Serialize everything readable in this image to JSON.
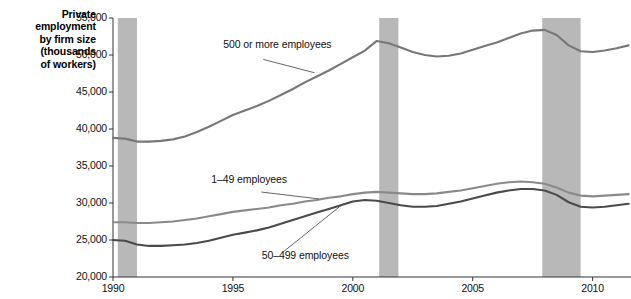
{
  "chart_data": {
    "type": "line",
    "title": "",
    "ylabel": "Private employment by firm size (thousands of workers)",
    "xlabel": "",
    "ylim": [
      20000,
      55000
    ],
    "xlim": [
      1990,
      2011.6
    ],
    "grid": false,
    "legend_position": "inline-annotations",
    "ytick_labels": [
      "55,000",
      "50,000",
      "45,000",
      "40,000",
      "35,000",
      "30,000",
      "25,000",
      "20,000"
    ],
    "ytick_values": [
      55000,
      50000,
      45000,
      40000,
      35000,
      30000,
      25000,
      20000
    ],
    "xtick_labels": [
      "1990",
      "1995",
      "2000",
      "2005",
      "2010"
    ],
    "xtick_values": [
      1990,
      1995,
      2000,
      2005,
      2010
    ],
    "annotations": [
      {
        "text": "500 or more employees",
        "x": 1994.6,
        "y": 51300
      },
      {
        "text": "1–49 employees",
        "x": 1994.1,
        "y": 33100
      },
      {
        "text": "50–499 employees",
        "x": 1996.2,
        "y": 22900
      }
    ],
    "shaded_regions": [
      {
        "name": "recession-1990-91",
        "x0": 1990.2,
        "x1": 1991.0
      },
      {
        "name": "recession-2001",
        "x0": 2001.1,
        "x1": 2001.9
      },
      {
        "name": "recession-2007-09",
        "x0": 2007.9,
        "x1": 2009.5
      }
    ],
    "series": [
      {
        "name": "500 or more employees",
        "color": "#777777",
        "x": [
          1990.0,
          1990.5,
          1991.0,
          1991.5,
          1992.0,
          1992.5,
          1993.0,
          1993.5,
          1994.0,
          1994.5,
          1995.0,
          1995.5,
          1996.0,
          1996.5,
          1997.0,
          1997.5,
          1998.0,
          1998.5,
          1999.0,
          1999.5,
          2000.0,
          2000.5,
          2001.0,
          2001.5,
          2002.0,
          2002.5,
          2003.0,
          2003.5,
          2004.0,
          2004.5,
          2005.0,
          2005.5,
          2006.0,
          2006.5,
          2007.0,
          2007.5,
          2008.0,
          2008.5,
          2009.0,
          2009.5,
          2010.0,
          2010.5,
          2011.0,
          2011.5
        ],
        "y": [
          38800,
          38700,
          38300,
          38300,
          38400,
          38600,
          39000,
          39600,
          40300,
          41100,
          41900,
          42500,
          43100,
          43800,
          44600,
          45400,
          46300,
          47100,
          47900,
          48800,
          49700,
          50600,
          51900,
          51600,
          51000,
          50400,
          50000,
          49800,
          49900,
          50200,
          50700,
          51200,
          51700,
          52300,
          52900,
          53300,
          53400,
          52700,
          51300,
          50500,
          50400,
          50600,
          50900,
          51300
        ]
      },
      {
        "name": "1–49 employees",
        "color": "#8a8a8a",
        "x": [
          1990.0,
          1990.5,
          1991.0,
          1991.5,
          1992.0,
          1992.5,
          1993.0,
          1993.5,
          1994.0,
          1994.5,
          1995.0,
          1995.5,
          1996.0,
          1996.5,
          1997.0,
          1997.5,
          1998.0,
          1998.5,
          1999.0,
          1999.5,
          2000.0,
          2000.5,
          2001.0,
          2001.5,
          2002.0,
          2002.5,
          2003.0,
          2003.5,
          2004.0,
          2004.5,
          2005.0,
          2005.5,
          2006.0,
          2006.5,
          2007.0,
          2007.5,
          2008.0,
          2008.5,
          2009.0,
          2009.5,
          2010.0,
          2010.5,
          2011.0,
          2011.5
        ],
        "y": [
          27400,
          27400,
          27300,
          27300,
          27400,
          27500,
          27700,
          27900,
          28200,
          28500,
          28800,
          29000,
          29200,
          29400,
          29700,
          29900,
          30200,
          30400,
          30700,
          30900,
          31200,
          31400,
          31500,
          31400,
          31300,
          31200,
          31200,
          31300,
          31500,
          31700,
          32000,
          32300,
          32600,
          32800,
          32900,
          32800,
          32600,
          32100,
          31400,
          31000,
          30900,
          31000,
          31100,
          31200
        ]
      },
      {
        "name": "50–499 employees",
        "color": "#4a4a4a",
        "x": [
          1990.0,
          1990.5,
          1991.0,
          1991.5,
          1992.0,
          1992.5,
          1993.0,
          1993.5,
          1994.0,
          1994.5,
          1995.0,
          1995.5,
          1996.0,
          1996.5,
          1997.0,
          1997.5,
          1998.0,
          1998.5,
          1999.0,
          1999.5,
          2000.0,
          2000.5,
          2001.0,
          2001.5,
          2002.0,
          2002.5,
          2003.0,
          2003.5,
          2004.0,
          2004.5,
          2005.0,
          2005.5,
          2006.0,
          2006.5,
          2007.0,
          2007.5,
          2008.0,
          2008.5,
          2009.0,
          2009.5,
          2010.0,
          2010.5,
          2011.0,
          2011.5
        ],
        "y": [
          25000,
          24900,
          24400,
          24200,
          24200,
          24300,
          24400,
          24600,
          24900,
          25300,
          25700,
          26000,
          26300,
          26700,
          27200,
          27700,
          28200,
          28700,
          29200,
          29700,
          30200,
          30400,
          30300,
          30000,
          29700,
          29500,
          29500,
          29600,
          29900,
          30200,
          30600,
          31000,
          31400,
          31700,
          31900,
          31900,
          31700,
          31100,
          30100,
          29500,
          29400,
          29500,
          29700,
          29900
        ]
      }
    ]
  },
  "axis": {
    "title_lines": [
      "Private",
      "employment",
      "by firm size",
      "(thousands",
      "of workers)"
    ]
  }
}
